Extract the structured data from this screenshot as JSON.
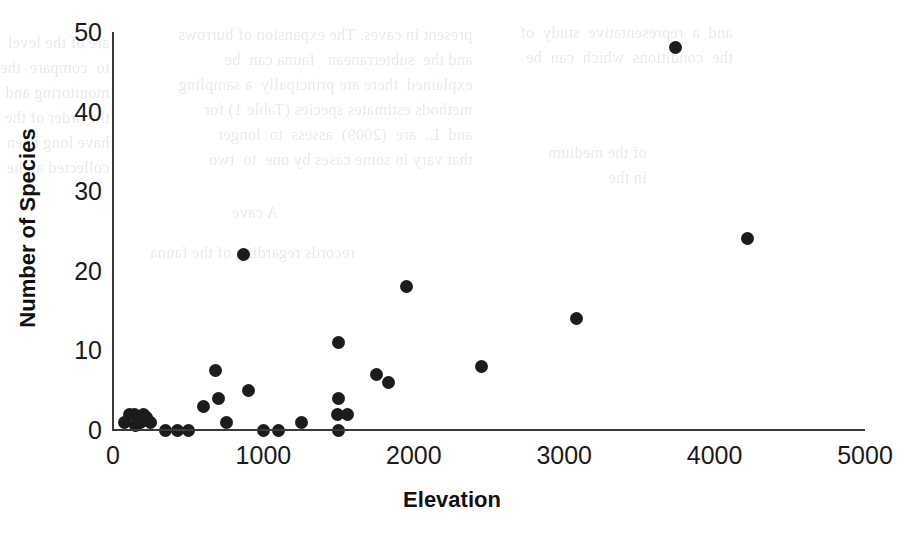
{
  "chart_data": {
    "type": "scatter",
    "title": "",
    "xlabel": "Elevation",
    "ylabel": "Number of Species",
    "xlim": [
      0,
      5000
    ],
    "ylim": [
      0,
      50
    ],
    "xticks": [
      0,
      1000,
      2000,
      3000,
      4000,
      5000
    ],
    "yticks": [
      0,
      10,
      20,
      30,
      40,
      50
    ],
    "xtick_labels": [
      "0",
      "1000",
      "2000",
      "3000",
      "4000",
      "5000"
    ],
    "ytick_labels": [
      "0",
      "10",
      "20",
      "30",
      "40",
      "50"
    ],
    "grid": false,
    "legend": null,
    "marker": "filled-circle",
    "marker_color": "#1c1c1c",
    "points": [
      {
        "x": 75,
        "y": 1
      },
      {
        "x": 110,
        "y": 2
      },
      {
        "x": 140,
        "y": 2
      },
      {
        "x": 150,
        "y": 0.6
      },
      {
        "x": 180,
        "y": 1
      },
      {
        "x": 205,
        "y": 2
      },
      {
        "x": 225,
        "y": 1.6
      },
      {
        "x": 250,
        "y": 1
      },
      {
        "x": 350,
        "y": 0
      },
      {
        "x": 430,
        "y": 0
      },
      {
        "x": 500,
        "y": 0
      },
      {
        "x": 600,
        "y": 3
      },
      {
        "x": 680,
        "y": 7.5
      },
      {
        "x": 700,
        "y": 4
      },
      {
        "x": 755,
        "y": 1
      },
      {
        "x": 870,
        "y": 22
      },
      {
        "x": 900,
        "y": 5
      },
      {
        "x": 1000,
        "y": 0
      },
      {
        "x": 1100,
        "y": 0
      },
      {
        "x": 1250,
        "y": 1
      },
      {
        "x": 1500,
        "y": 11
      },
      {
        "x": 1500,
        "y": 4
      },
      {
        "x": 1490,
        "y": 2
      },
      {
        "x": 1560,
        "y": 2
      },
      {
        "x": 1500,
        "y": 0
      },
      {
        "x": 1750,
        "y": 7
      },
      {
        "x": 1830,
        "y": 6
      },
      {
        "x": 1950,
        "y": 18
      },
      {
        "x": 2450,
        "y": 8
      },
      {
        "x": 3080,
        "y": 14
      },
      {
        "x": 3740,
        "y": 48
      },
      {
        "x": 4220,
        "y": 24
      }
    ]
  },
  "background_showthrough": {
    "note": "faint mirrored bleed-through text from reverse of scanned page",
    "blocks": [
      {
        "left": 178,
        "top": 22,
        "align": "left",
        "text": "present in caves. The expansion of burrows\nand the  subterranean   fauna can  be\nexplained  there are principally  a sampling\nmethods estimates species (Table 1) for\nand  L.  are  (2009)  assess  to  longer\nthat vary in some cases by one  to  two"
      },
      {
        "left": 0,
        "top": 30,
        "align": "left",
        "text": "are of the level\nto  compare  the\nmonitoring and\nthe order of the\nhave long been\ncollected at the"
      },
      {
        "left": 520,
        "top": 20,
        "align": "left",
        "text": "and  a  representative  study  of\nthe  conditions  which  can  be"
      },
      {
        "left": 548,
        "top": 140,
        "align": "left",
        "text": "of the medium\nin the"
      },
      {
        "left": 232,
        "top": 200,
        "align": "left",
        "text": "A cave"
      },
      {
        "left": 150,
        "top": 240,
        "align": "left",
        "text": "records regarding of the fauna"
      }
    ]
  }
}
